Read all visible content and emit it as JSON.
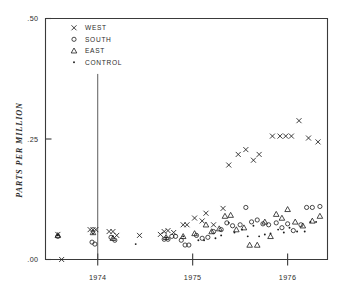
{
  "chart_data": {
    "type": "scatter",
    "title": "",
    "xlabel": "",
    "ylabel": "PARTS PER MILLION",
    "xlim": [
      1973.45,
      1976.42
    ],
    "ylim": [
      0.0,
      0.5
    ],
    "grid": false,
    "legend_position": "top-left",
    "x_ticks": [
      {
        "value": 1974,
        "label": "1974"
      },
      {
        "value": 1975,
        "label": "1975"
      },
      {
        "value": 1976,
        "label": "1976"
      }
    ],
    "y_ticks": [
      {
        "value": 0.0,
        "label": ".00"
      },
      {
        "value": 0.25,
        "label": ".25"
      },
      {
        "value": 0.5,
        "label": ".50"
      }
    ],
    "annotations": [
      {
        "type": "vline",
        "x": 1974.0,
        "y_from": 0.0,
        "y_to": 0.385,
        "label": ""
      }
    ],
    "series": [
      {
        "name": "WEST",
        "marker": "x",
        "points": [
          [
            1973.58,
            0.052
          ],
          [
            1973.62,
            1.97362e-06
          ],
          [
            1973.92,
            0.062
          ],
          [
            1973.95,
            0.062
          ],
          [
            1973.98,
            0.062
          ],
          [
            1974.12,
            0.058
          ],
          [
            1974.16,
            0.058
          ],
          [
            1974.2,
            0.05
          ],
          [
            1974.44,
            0.05
          ],
          [
            1974.66,
            0.052
          ],
          [
            1974.7,
            0.058
          ],
          [
            1974.74,
            0.06
          ],
          [
            1974.8,
            0.056
          ],
          [
            1974.9,
            0.072
          ],
          [
            1974.94,
            0.072
          ],
          [
            1975.02,
            0.086
          ],
          [
            1975.1,
            0.08
          ],
          [
            1975.14,
            0.096
          ],
          [
            1975.22,
            0.072
          ],
          [
            1975.32,
            0.106
          ],
          [
            1975.38,
            0.196
          ],
          [
            1975.48,
            0.218
          ],
          [
            1975.56,
            0.228
          ],
          [
            1975.64,
            0.206
          ],
          [
            1975.7,
            0.218
          ],
          [
            1975.84,
            0.256
          ],
          [
            1975.92,
            0.256
          ],
          [
            1975.98,
            0.256
          ],
          [
            1976.04,
            0.256
          ],
          [
            1976.12,
            0.288
          ],
          [
            1976.22,
            0.252
          ],
          [
            1976.32,
            0.244
          ]
        ]
      },
      {
        "name": "SOUTH",
        "marker": "o",
        "points": [
          [
            1973.58,
            0.048
          ],
          [
            1973.94,
            0.036
          ],
          [
            1973.97,
            0.032
          ],
          [
            1974.14,
            0.046
          ],
          [
            1974.18,
            0.04
          ],
          [
            1974.7,
            0.042
          ],
          [
            1974.74,
            0.042
          ],
          [
            1974.78,
            0.048
          ],
          [
            1974.82,
            0.048
          ],
          [
            1974.88,
            0.04
          ],
          [
            1974.92,
            0.03
          ],
          [
            1974.96,
            0.03
          ],
          [
            1975.04,
            0.05
          ],
          [
            1975.1,
            0.044
          ],
          [
            1975.16,
            0.046
          ],
          [
            1975.22,
            0.058
          ],
          [
            1975.3,
            0.062
          ],
          [
            1975.36,
            0.076
          ],
          [
            1975.42,
            0.07
          ],
          [
            1975.5,
            0.072
          ],
          [
            1975.56,
            0.108
          ],
          [
            1975.62,
            0.078
          ],
          [
            1975.68,
            0.082
          ],
          [
            1975.74,
            0.074
          ],
          [
            1975.8,
            0.072
          ],
          [
            1975.88,
            0.076
          ],
          [
            1975.94,
            0.066
          ],
          [
            1976.0,
            0.074
          ],
          [
            1976.06,
            0.06
          ],
          [
            1976.14,
            0.072
          ],
          [
            1976.2,
            0.108
          ],
          [
            1976.26,
            0.108
          ],
          [
            1976.34,
            0.11
          ]
        ]
      },
      {
        "name": "EAST",
        "marker": "triangle",
        "points": [
          [
            1973.58,
            0.05
          ],
          [
            1973.95,
            0.056
          ],
          [
            1974.16,
            0.044
          ],
          [
            1974.72,
            0.046
          ],
          [
            1974.9,
            0.048
          ],
          [
            1975.02,
            0.054
          ],
          [
            1975.14,
            0.072
          ],
          [
            1975.2,
            0.058
          ],
          [
            1975.28,
            0.064
          ],
          [
            1975.34,
            0.09
          ],
          [
            1975.4,
            0.092
          ],
          [
            1975.46,
            0.062
          ],
          [
            1975.54,
            0.066
          ],
          [
            1975.6,
            0.03
          ],
          [
            1975.68,
            0.03
          ],
          [
            1975.76,
            0.078
          ],
          [
            1975.82,
            0.048
          ],
          [
            1975.88,
            0.094
          ],
          [
            1975.94,
            0.086
          ],
          [
            1976.0,
            0.104
          ],
          [
            1976.08,
            0.078
          ],
          [
            1976.16,
            0.07
          ],
          [
            1976.26,
            0.08
          ],
          [
            1976.34,
            0.09
          ]
        ]
      },
      {
        "name": "CONTROL",
        "marker": "dot",
        "points": [
          [
            1973.58,
            0.05
          ],
          [
            1973.95,
            0.054
          ],
          [
            1974.16,
            0.048
          ],
          [
            1974.4,
            0.032
          ],
          [
            1974.72,
            0.046
          ],
          [
            1974.9,
            0.048
          ],
          [
            1975.06,
            0.04
          ],
          [
            1975.12,
            0.04
          ],
          [
            1975.24,
            0.044
          ],
          [
            1975.3,
            0.05
          ],
          [
            1975.38,
            0.076
          ],
          [
            1975.44,
            0.056
          ],
          [
            1975.52,
            0.062
          ],
          [
            1975.58,
            0.048
          ],
          [
            1975.64,
            0.07
          ],
          [
            1975.7,
            0.048
          ],
          [
            1975.76,
            0.052
          ],
          [
            1975.82,
            0.054
          ],
          [
            1975.9,
            0.062
          ],
          [
            1975.96,
            0.056
          ],
          [
            1976.02,
            0.066
          ],
          [
            1976.1,
            0.058
          ],
          [
            1976.18,
            0.058
          ],
          [
            1976.24,
            0.078
          ],
          [
            1976.3,
            0.078
          ]
        ]
      }
    ]
  },
  "legend": {
    "entries": [
      {
        "label": "WEST",
        "marker": "x"
      },
      {
        "label": "SOUTH",
        "marker": "o"
      },
      {
        "label": "EAST",
        "marker": "triangle"
      },
      {
        "label": "CONTROL",
        "marker": "dot"
      }
    ]
  }
}
